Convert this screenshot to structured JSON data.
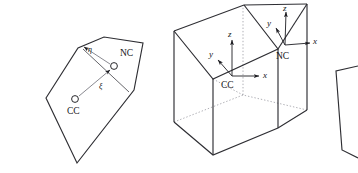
{
  "figure": {
    "background_color": "#ffffff",
    "stroke_color": "#2e2e33",
    "hidden_stroke_color": "#9a9aa2",
    "label_color": "#151519",
    "width": 358,
    "height": 173
  },
  "panels": {
    "left_2d": {
      "name": "two-dimensional face",
      "labels": {
        "cell_center": "CC",
        "node_center": "NC",
        "xi": "ξ",
        "eta": "η"
      },
      "outline_points": "46,98 78,48 104,37 143,43 134,90 77,163",
      "cc_marker": {
        "cx": 75,
        "cy": 99,
        "r": 3.4
      },
      "nc_marker": {
        "cx": 114,
        "cy": 66,
        "r": 3.4
      },
      "xi_vector": {
        "x1": 78,
        "y1": 97,
        "x2": 111,
        "y2": 69
      },
      "eta_vector": {
        "x1": 111,
        "y1": 64,
        "x2": 83,
        "y2": 48
      },
      "face_line": {
        "x1": 83,
        "y1": 49,
        "x2": 129,
        "y2": 93
      },
      "label_positions": {
        "cc": {
          "x": 67,
          "y": 114
        },
        "nc": {
          "x": 120,
          "y": 56
        },
        "xi": {
          "x": 99,
          "y": 88
        },
        "eta": {
          "x": 89,
          "y": 52
        }
      }
    },
    "middle_3d": {
      "name": "three-dimensional prismatic control volume",
      "labels": {
        "cell_center": "CC",
        "node_center": "NC",
        "x_axis": "x",
        "y_axis": "y",
        "z_axis": "z"
      },
      "cc_axes": {
        "origin": {
          "x": 232,
          "y": 76
        },
        "x_tip": {
          "x": 262,
          "y": 76
        },
        "y_tip": {
          "x": 215,
          "y": 57
        },
        "z_tip": {
          "x": 232,
          "y": 37
        },
        "labels": {
          "x": {
            "x": 264,
            "y": 75
          },
          "y": {
            "x": 211,
            "y": 54
          },
          "z": {
            "x": 229,
            "y": 35
          },
          "origin": {
            "x": 222,
            "y": 87
          }
        }
      },
      "nc_axes": {
        "origin": {
          "x": 285,
          "y": 45
        },
        "x_tip": {
          "x": 313,
          "y": 42
        },
        "y_tip": {
          "x": 272,
          "y": 24
        },
        "z_tip": {
          "x": 286,
          "y": 9
        },
        "labels": {
          "x": {
            "x": 315,
            "y": 41
          },
          "y": {
            "x": 269,
            "y": 22
          },
          "z": {
            "x": 284,
            "y": 9
          },
          "origin": {
            "x": 277,
            "y": 58
          }
        }
      },
      "visible_edges": [
        "174,31 174,122",
        "213,79 213,155",
        "278,49 278,128",
        "307,4 307,110",
        "174,31 244,5",
        "244,5 307,4",
        "174,31 213,79",
        "213,79 278,49",
        "244,5 278,49",
        "278,49 307,4",
        "174,122 213,155",
        "213,155 278,128",
        "278,128 307,110",
        "244,5 244,5"
      ],
      "hidden_edges": [
        "174,122 243,95",
        "243,95 307,110",
        "243,95 243,5",
        "213,79 243,95"
      ]
    },
    "right_partial": {
      "name": "partial clipped face at right border",
      "outline_points": "336,71 358,66 358,158 342,150"
    }
  }
}
